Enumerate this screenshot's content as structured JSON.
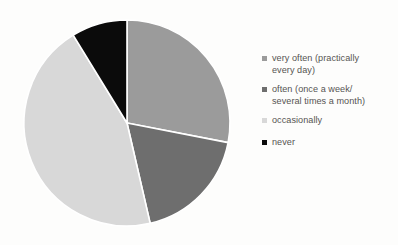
{
  "chart_data": {
    "type": "pie",
    "title": "",
    "legend_position": "right",
    "grid": false,
    "categories": [
      "very often (practically every day)",
      "often (once a week/ several times a month)",
      "occasionally",
      "never"
    ],
    "values": [
      28.1,
      18.3,
      44.8,
      8.8
    ],
    "unit": "percent",
    "colors": [
      "#9b9b9b",
      "#6e6e6e",
      "#d8d8d8",
      "#0b0b0b"
    ],
    "slice_order": "clockwise from 12 o'clock",
    "start_angles_deg": [
      0,
      101,
      167,
      328.5
    ],
    "end_angles_deg": [
      101,
      167,
      328.5,
      360
    ],
    "separator_color": "#ffffff",
    "labels_shown": false,
    "xlabel": "",
    "ylabel": ""
  },
  "legend": {
    "entries": [
      {
        "label": "very often (practically\nevery day)",
        "color": "#9b9b9b",
        "swatch_name": "legend-swatch-very-often"
      },
      {
        "label": "often (once a week/\nseveral times a month)",
        "color": "#6e6e6e",
        "swatch_name": "legend-swatch-often"
      },
      {
        "label": "occasionally",
        "color": "#d8d8d8",
        "swatch_name": "legend-swatch-occasionally"
      },
      {
        "label": "never",
        "color": "#0b0b0b",
        "swatch_name": "legend-swatch-never"
      }
    ]
  },
  "canvas": {
    "background": "#fdfdfc",
    "pie_center_x": 127,
    "pie_center_y": 123,
    "pie_radius": 103
  }
}
